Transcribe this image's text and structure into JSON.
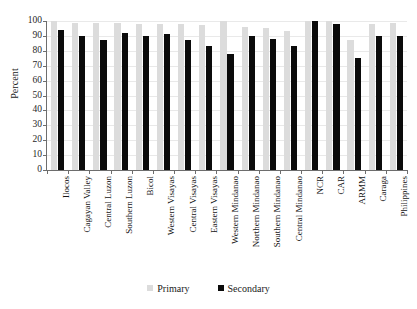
{
  "chart_data": {
    "type": "bar",
    "title": "",
    "xlabel": "",
    "ylabel": "Percent",
    "ylim": [
      0,
      100
    ],
    "ytick_step": 10,
    "yticks": [
      0,
      10,
      20,
      30,
      40,
      50,
      60,
      70,
      80,
      90,
      100
    ],
    "grid": true,
    "legend_position": "bottom",
    "categories": [
      "Ilocos",
      "Cagayan Valley",
      "Central Luzon",
      "Southern Luzon",
      "Bicol",
      "Western Visayas",
      "Central Visayas",
      "Eastern Visayas",
      "Western Mindanao",
      "Northern Mindanao",
      "Southern Mindanao",
      "Central Mindanao",
      "NCR",
      "CAR",
      "ARMM",
      "Caraga",
      "Philippines"
    ],
    "series": [
      {
        "name": "Primary",
        "color": "#dcdcdc",
        "values": [
          100,
          99,
          99,
          99,
          98,
          98,
          98,
          97,
          100,
          96,
          95,
          93,
          100,
          100,
          87,
          98,
          99
        ]
      },
      {
        "name": "Secondary",
        "color": "#0b0b0b",
        "values": [
          94,
          90,
          87.5,
          92,
          90,
          91,
          87.5,
          83,
          78,
          90,
          88,
          83,
          100,
          98,
          75,
          90,
          90
        ]
      }
    ]
  },
  "legend": {
    "items": [
      {
        "label": "Primary",
        "color": "#dcdcdc"
      },
      {
        "label": "Secondary",
        "color": "#0b0b0b"
      }
    ]
  },
  "axes": {
    "y_title": "Percent"
  }
}
